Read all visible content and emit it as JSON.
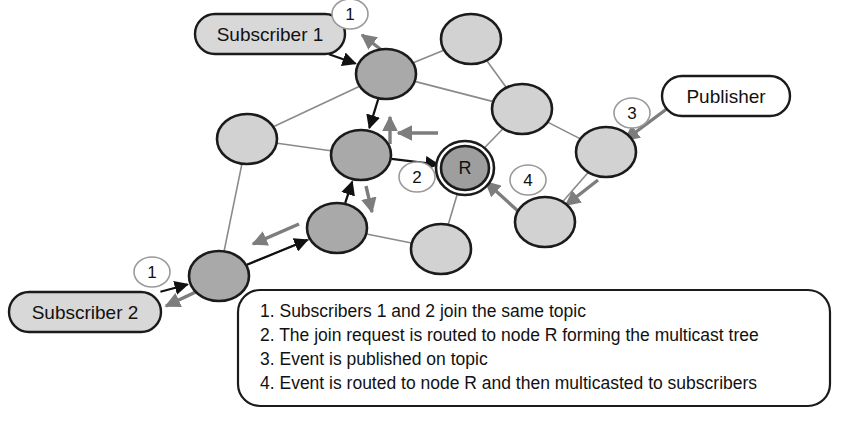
{
  "figure": {
    "type": "network-diagram",
    "background": "#ffffff"
  },
  "colors": {
    "tree_node_fill": "#a9a9a9",
    "plain_node_fill": "#d2d2d2",
    "root_node_fill": "#9e9e9e",
    "endpoint_fill_subscriber": "#d8d8d8",
    "endpoint_fill_publisher": "#ffffff",
    "node_stroke": "#1b1b1b",
    "edge_stroke": "#8a8a8a",
    "tree_arrow_stroke": "#111111",
    "flow_arrow_stroke": "#7d7d7d",
    "badge_stroke": "#9a9a9a",
    "legend_stroke": "#1b1b1b",
    "text": "#111111"
  },
  "endpoints": [
    {
      "id": "subscriber1",
      "label": "Subscriber 1",
      "cx": 270,
      "cy": 34,
      "w": 150,
      "h": 40,
      "fill": "#d8d8d8"
    },
    {
      "id": "subscriber2",
      "label": "Subscriber 2",
      "cx": 85,
      "cy": 312,
      "w": 152,
      "h": 40,
      "fill": "#d8d8d8"
    },
    {
      "id": "publisher",
      "label": "Publisher",
      "cx": 726,
      "cy": 96,
      "w": 128,
      "h": 40,
      "fill": "#ffffff"
    }
  ],
  "nodes": [
    {
      "id": "n_sub1_attach",
      "cx": 386,
      "cy": 74,
      "rx": 30,
      "ry": 25,
      "kind": "tree",
      "fill": "#a9a9a9",
      "label": ""
    },
    {
      "id": "n_mid_tree",
      "cx": 361,
      "cy": 155,
      "rx": 30,
      "ry": 25,
      "kind": "tree",
      "fill": "#a9a9a9",
      "label": ""
    },
    {
      "id": "n_low_tree",
      "cx": 337,
      "cy": 228,
      "rx": 30,
      "ry": 25,
      "kind": "tree",
      "fill": "#a9a9a9",
      "label": ""
    },
    {
      "id": "n_sub2_attach",
      "cx": 219,
      "cy": 276,
      "rx": 30,
      "ry": 25,
      "kind": "tree",
      "fill": "#a9a9a9",
      "label": ""
    },
    {
      "id": "n_root",
      "cx": 465,
      "cy": 168,
      "rx": 24,
      "ry": 22,
      "kind": "root",
      "fill": "#9e9e9e",
      "label": "R"
    },
    {
      "id": "n_left_plain",
      "cx": 247,
      "cy": 139,
      "rx": 30,
      "ry": 25,
      "kind": "plain",
      "fill": "#d2d2d2",
      "label": ""
    },
    {
      "id": "n_top_plain",
      "cx": 471,
      "cy": 39,
      "rx": 30,
      "ry": 25,
      "kind": "plain",
      "fill": "#d2d2d2",
      "label": ""
    },
    {
      "id": "n_upper_right_plain",
      "cx": 522,
      "cy": 109,
      "rx": 30,
      "ry": 25,
      "kind": "plain",
      "fill": "#d2d2d2",
      "label": ""
    },
    {
      "id": "n_pub_attach",
      "cx": 606,
      "cy": 152,
      "rx": 30,
      "ry": 25,
      "kind": "plain",
      "fill": "#d2d2d2",
      "label": ""
    },
    {
      "id": "n_lower_right_plain",
      "cx": 545,
      "cy": 222,
      "rx": 30,
      "ry": 25,
      "kind": "plain",
      "fill": "#d2d2d2",
      "label": ""
    },
    {
      "id": "n_bottom_plain",
      "cx": 441,
      "cy": 249,
      "rx": 30,
      "ry": 25,
      "kind": "plain",
      "fill": "#d2d2d2",
      "label": ""
    }
  ],
  "edges": [
    {
      "from": "n_sub1_attach",
      "to": "n_left_plain"
    },
    {
      "from": "n_sub1_attach",
      "to": "n_top_plain"
    },
    {
      "from": "n_sub1_attach",
      "to": "n_upper_right_plain"
    },
    {
      "from": "n_left_plain",
      "to": "n_mid_tree"
    },
    {
      "from": "n_left_plain",
      "to": "n_sub2_attach"
    },
    {
      "from": "n_top_plain",
      "to": "n_upper_right_plain"
    },
    {
      "from": "n_upper_right_plain",
      "to": "n_root"
    },
    {
      "from": "n_upper_right_plain",
      "to": "n_pub_attach"
    },
    {
      "from": "n_pub_attach",
      "to": "n_lower_right_plain"
    },
    {
      "from": "n_root",
      "to": "n_bottom_plain"
    },
    {
      "from": "n_low_tree",
      "to": "n_bottom_plain"
    },
    {
      "from": "n_low_tree",
      "to": "n_sub2_attach"
    },
    {
      "from": "n_mid_tree",
      "to": "n_low_tree"
    },
    {
      "from": "n_sub2_attach",
      "to": "n_low_tree"
    }
  ],
  "tree_arrows": [
    {
      "id": "sub1-to-node",
      "from": "subscriber1",
      "to": "n_sub1_attach"
    },
    {
      "id": "node-to-mid",
      "from": "n_sub1_attach",
      "to": "n_mid_tree"
    },
    {
      "id": "low-to-mid",
      "from": "n_low_tree",
      "to": "n_mid_tree"
    },
    {
      "id": "mid-to-root",
      "from": "n_mid_tree",
      "to": "n_root"
    },
    {
      "id": "sub2-to-attach",
      "from": "subscriber2",
      "to": "n_sub2_attach"
    },
    {
      "id": "attach-to-low",
      "from": "n_sub2_attach",
      "to": "n_low_tree"
    }
  ],
  "flow_arrows": [
    {
      "id": "flow-to-sub1",
      "note": "event delivered to Subscriber 1"
    },
    {
      "id": "flow-up-mid",
      "note": "event travels up the tree"
    },
    {
      "id": "flow-root-to-mid",
      "note": "event from node R toward tree"
    },
    {
      "id": "flow-mid-down",
      "note": "event multicast downward"
    },
    {
      "id": "flow-low-to-sub2",
      "note": "event delivered toward Subscriber 2"
    },
    {
      "id": "flow-attach-to-sub2",
      "note": "event delivered to Subscriber 2"
    },
    {
      "id": "flow-pub-to-node",
      "note": "publisher injects event"
    },
    {
      "id": "flow-node-down",
      "note": "event routed down to node"
    },
    {
      "id": "flow-bottom-to-root",
      "note": "event routed to node R"
    }
  ],
  "step_badges": [
    {
      "id": "badge-1-top",
      "label": "1",
      "cx": 350,
      "cy": 14,
      "rx": 18,
      "ry": 15
    },
    {
      "id": "badge-2",
      "label": "2",
      "cx": 417,
      "cy": 177,
      "rx": 18,
      "ry": 15
    },
    {
      "id": "badge-3",
      "label": "3",
      "cx": 632,
      "cy": 113,
      "rx": 18,
      "ry": 15
    },
    {
      "id": "badge-4",
      "label": "4",
      "cx": 528,
      "cy": 180,
      "rx": 18,
      "ry": 15
    },
    {
      "id": "badge-1-bottom",
      "label": "1",
      "cx": 152,
      "cy": 272,
      "rx": 18,
      "ry": 15
    }
  ],
  "legend": {
    "box": {
      "x": 238,
      "y": 290,
      "w": 592,
      "h": 116,
      "r": 22
    },
    "lines": [
      "1. Subscribers 1 and 2 join the same topic",
      "2. The join request is routed to node R forming the multicast tree",
      "3. Event is published on topic",
      "4. Event is routed to node R and then multicasted to subscribers"
    ]
  }
}
